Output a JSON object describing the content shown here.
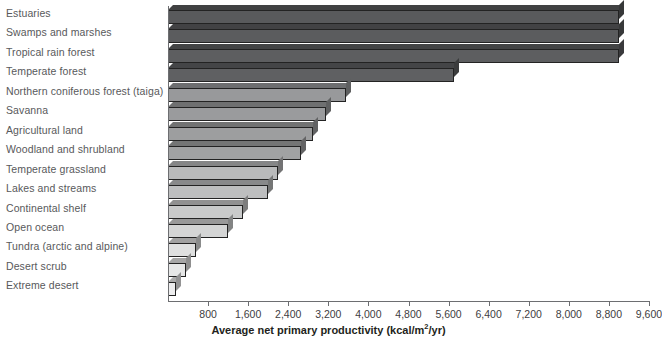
{
  "chart_data": {
    "type": "bar",
    "orientation": "horizontal",
    "title": "",
    "xlabel": "Average net primary productivity (kcal/m2/yr)",
    "xlabel_parts": {
      "pre": "Average net primary productivity (kcal/m",
      "sup": "2",
      "post": "/yr)"
    },
    "ylabel": "",
    "xlim": [
      0,
      9600
    ],
    "xticks": [
      800,
      1600,
      2400,
      3200,
      4000,
      4800,
      5600,
      6400,
      7200,
      8000,
      8800,
      9600
    ],
    "xtick_labels": [
      "800",
      "1,600",
      "2,400",
      "3,200",
      "4,000",
      "4,800",
      "5,600",
      "6,400",
      "7,200",
      "8,000",
      "8,800",
      "9,600"
    ],
    "grid": false,
    "legend": null,
    "categories": [
      "Estuaries",
      "Swamps and marshes",
      "Tropical rain forest",
      "Temperate forest",
      "Northern coniferous forest (taiga)",
      "Savanna",
      "Agricultural land",
      "Woodland and shrubland",
      "Temperate grassland",
      "Lakes and streams",
      "Continental shelf",
      "Open ocean",
      "Tundra (arctic and alpine)",
      "Desert scrub",
      "Extreme desert"
    ],
    "values": [
      9000,
      9000,
      9000,
      5700,
      3550,
      3150,
      2900,
      2650,
      2200,
      2000,
      1500,
      1200,
      550,
      350,
      150
    ],
    "bar_colors": [
      "#595a5c",
      "#5b5c5e",
      "#5d5e60",
      "#5f6062",
      "#98999b",
      "#9a9b9d",
      "#9d9e9f",
      "#a1a2a3",
      "#b9babb",
      "#bdbebf",
      "#c9caca",
      "#d4d5d5",
      "#dfe0e0",
      "#e6e7e7",
      "#ededee"
    ],
    "label_color": "#58595b",
    "axis_color": "#6d6e71"
  }
}
